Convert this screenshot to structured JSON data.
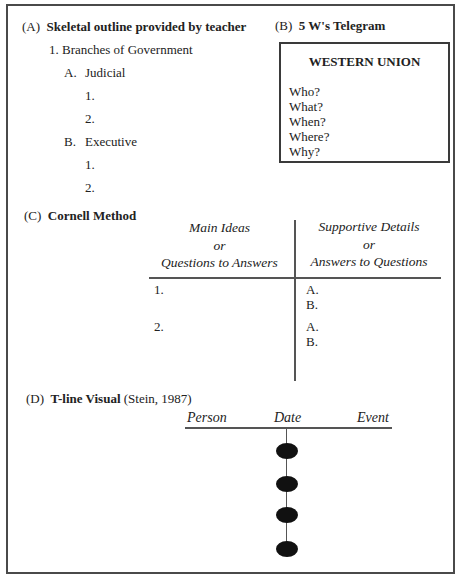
{
  "section_a": {
    "label": "(A)",
    "title": "Skeletal outline provided by teacher",
    "outline": {
      "topic": "1.  Branches of Government",
      "sub_a": {
        "marker": "A.",
        "text": "Judicial",
        "items": [
          "1.",
          "2."
        ]
      },
      "sub_b": {
        "marker": "B.",
        "text": "Executive",
        "items": [
          "1.",
          "2."
        ]
      }
    }
  },
  "section_b": {
    "label": "(B)",
    "title": "5 W's Telegram",
    "telegram": {
      "header": "WESTERN UNION",
      "questions": [
        "Who?",
        "What?",
        "When?",
        "Where?",
        "Why?"
      ]
    }
  },
  "section_c": {
    "label": "(C)",
    "title": "Cornell Method",
    "left_header": [
      "Main Ideas",
      "or",
      "Questions to  Answers"
    ],
    "right_header": [
      "Supportive Details",
      "or",
      "Answers to Questions"
    ],
    "rows": [
      {
        "left": "1.",
        "right": [
          "A.",
          "B."
        ]
      },
      {
        "left": "2.",
        "right": [
          "A.",
          "B."
        ]
      }
    ]
  },
  "section_d": {
    "label": "(D)",
    "title": "T-line Visual",
    "citation": "(Stein, 1987)",
    "columns": [
      "Person",
      "Date",
      "Event"
    ],
    "dot_count": 4
  }
}
